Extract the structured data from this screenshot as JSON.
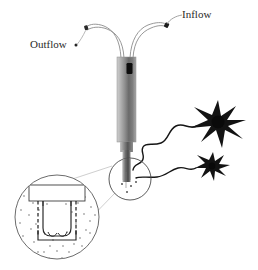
{
  "figure": {
    "background_color": "#ffffff",
    "line_color": "#3a3a3a",
    "ink_color": "#1a1a1a"
  },
  "labels": {
    "outflow": "Outflow",
    "inflow": "Inflow"
  },
  "parts": {
    "probe_shaft": "probe-shaft",
    "probe_tip": "probe-tip",
    "outflow_tube": "outflow-tube",
    "inflow_tube": "inflow-tube",
    "outflow_marker": "outflow-marker",
    "inflow_marker": "inflow-marker",
    "dark_window": "probe-window",
    "callout_circle": "tip-callout-circle",
    "magnified_circle": "magnified-tip-view",
    "membrane": "dialysis-membrane",
    "probe_block": "probe-body-block",
    "neuron_large": "neuron-large",
    "neuron_small": "neuron-small",
    "neurite_large": "neurite-large",
    "neurite_small": "neurite-small",
    "callout_leader_upper": "callout-leader-upper",
    "callout_leader_lower": "callout-leader-lower",
    "analyte_particles": "analyte-particles"
  },
  "colors": {
    "shaft_light": "#d9d9d9",
    "shaft_mid": "#9e9e9e",
    "shaft_dark": "#5a5a5a",
    "shaft_darkest": "#3d3d3d",
    "window": "#101010",
    "neuron": "#111111",
    "outline": "#555555",
    "particle": "#9a9a9a"
  },
  "geometry": {
    "width": 258,
    "height": 270,
    "callout_circle": {
      "cx": 130,
      "cy": 179,
      "r": 21
    },
    "magnified_circle": {
      "cx": 57,
      "cy": 217,
      "r": 42
    },
    "shaft": {
      "x": 117,
      "y": 57,
      "w": 19,
      "h": 85
    },
    "tip": {
      "x": 122,
      "y": 142,
      "w": 9,
      "h": 38
    }
  },
  "particles_count": 46
}
